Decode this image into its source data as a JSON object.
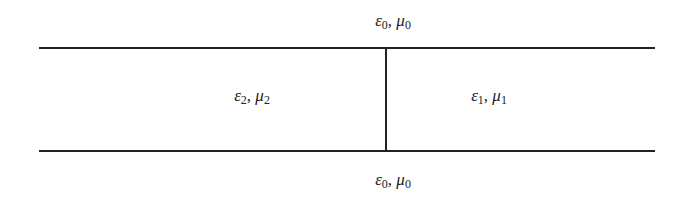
{
  "diagram": {
    "regions": {
      "top": {
        "eps": "ε",
        "eps_sub": "0",
        "sep": ", ",
        "mu": "μ",
        "mu_sub": "0"
      },
      "left": {
        "eps": "ε",
        "eps_sub": "2",
        "sep": ", ",
        "mu": "μ",
        "mu_sub": "2"
      },
      "right": {
        "eps": "ε",
        "eps_sub": "1",
        "sep": ", ",
        "mu": "μ",
        "mu_sub": "1"
      },
      "bottom": {
        "eps": "ε",
        "eps_sub": "0",
        "sep": ", ",
        "mu": "μ",
        "mu_sub": "0"
      }
    },
    "colors": {
      "line": "#222222",
      "text": "#222222",
      "background": "#ffffff"
    }
  }
}
